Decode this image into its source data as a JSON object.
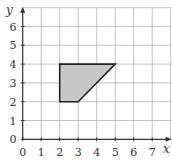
{
  "chart_data": {
    "type": "area",
    "title": "",
    "xlabel": "x",
    "ylabel": "y",
    "xlim": [
      0,
      8
    ],
    "ylim": [
      0,
      7
    ],
    "grid": true,
    "x_ticks": [
      "0",
      "1",
      "2",
      "3",
      "4",
      "5",
      "6",
      "7"
    ],
    "y_ticks": [
      "0",
      "1",
      "2",
      "3",
      "4",
      "5",
      "6"
    ],
    "shapes": [
      {
        "name": "shaded quadrilateral",
        "vertices": [
          [
            2,
            2
          ],
          [
            2,
            4
          ],
          [
            5,
            4
          ],
          [
            3,
            2
          ]
        ],
        "fill": "#c8c8c8",
        "stroke": "#222222"
      }
    ]
  },
  "axes": {
    "x_label": "x",
    "y_label": "y"
  },
  "colors": {
    "grid": "#b4b4b4",
    "axis": "#333333",
    "shape_fill": "#c8c8c8",
    "shape_stroke": "#222222"
  }
}
